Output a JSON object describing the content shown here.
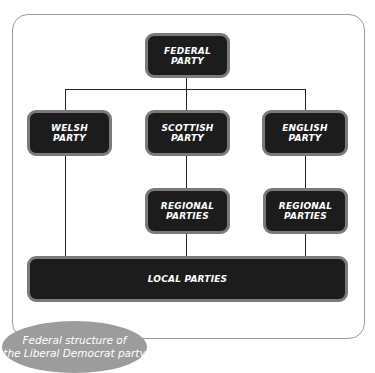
{
  "diagram": {
    "title": "Federal structure of the Liberal Democrat party",
    "nodes": {
      "federal": {
        "line1": "FEDERAL",
        "line2": "PARTY"
      },
      "welsh": {
        "line1": "WELSH",
        "line2": "PARTY"
      },
      "scottish": {
        "line1": "SCOTTISH",
        "line2": "PARTY"
      },
      "english": {
        "line1": "ENGLISH",
        "line2": "PARTY"
      },
      "regional_scottish": {
        "line1": "REGIONAL",
        "line2": "PARTIES"
      },
      "regional_english": {
        "line1": "REGIONAL",
        "line2": "PARTIES"
      },
      "local": {
        "label": "LOCAL PARTIES"
      }
    },
    "edges": [
      [
        "federal",
        "welsh"
      ],
      [
        "federal",
        "scottish"
      ],
      [
        "federal",
        "english"
      ],
      [
        "scottish",
        "regional_scottish"
      ],
      [
        "english",
        "regional_english"
      ],
      [
        "welsh",
        "local"
      ],
      [
        "regional_scottish",
        "local"
      ],
      [
        "regional_english",
        "local"
      ]
    ],
    "caption": {
      "line1": "Federal structure of",
      "line2": "the Liberal Democrat party"
    }
  },
  "colors": {
    "box_fill": "#1c1c1c",
    "box_border": "#7a7a7a",
    "caption_fill": "#9c9c9c",
    "frame_border": "#9a9a9a"
  }
}
